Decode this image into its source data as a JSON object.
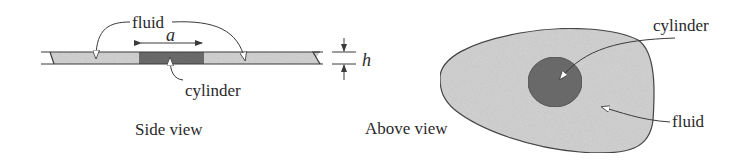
{
  "figure": {
    "side_view": {
      "caption": "Side view",
      "fluid_label": "fluid",
      "cylinder_label": "cylinder",
      "width_symbol": "a",
      "height_symbol": "h"
    },
    "above_view": {
      "caption": "Above view",
      "cylinder_label": "cylinder",
      "fluid_label": "fluid"
    },
    "colors": {
      "fluid_fill": "#d6d6d6",
      "cylinder_fill": "#6e6e6e",
      "outline": "#3a3a3a",
      "text": "#2a2a2a"
    }
  }
}
